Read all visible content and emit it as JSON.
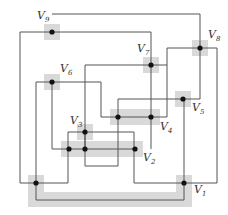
{
  "diagram": {
    "type": "grid-graph",
    "colors": {
      "line": "#555555",
      "highlight": "#d9d9d9",
      "dot": "#111111"
    },
    "vertices": [
      {
        "id": "V1",
        "label": "V",
        "sub": "1",
        "x": 184,
        "y": 183,
        "lx": 194,
        "ly": 193
      },
      {
        "id": "V2",
        "label": "V",
        "sub": "2",
        "x": 135,
        "y": 149,
        "lx": 143,
        "ly": 161
      },
      {
        "id": "V3",
        "label": "V",
        "sub": "3",
        "x": 85,
        "y": 132,
        "lx": 70,
        "ly": 124
      },
      {
        "id": "V4",
        "label": "V",
        "sub": "4",
        "x": 151,
        "y": 117,
        "lx": 160,
        "ly": 130
      },
      {
        "id": "V5",
        "label": "V",
        "sub": "5",
        "x": 183,
        "y": 99,
        "lx": 192,
        "ly": 111
      },
      {
        "id": "V6",
        "label": "V",
        "sub": "6",
        "x": 52,
        "y": 82,
        "lx": 60,
        "ly": 72
      },
      {
        "id": "V7",
        "label": "V",
        "sub": "7",
        "x": 151,
        "y": 65,
        "lx": 137,
        "ly": 52
      },
      {
        "id": "V8",
        "label": "V",
        "sub": "8",
        "x": 200,
        "y": 48,
        "lx": 208,
        "ly": 38
      },
      {
        "id": "V9",
        "label": "V",
        "sub": "9",
        "x": 52,
        "y": 32,
        "lx": 37,
        "ly": 19
      }
    ],
    "extra_dots": [
      {
        "x": 118,
        "y": 117
      },
      {
        "x": 69,
        "y": 149
      },
      {
        "x": 85,
        "y": 149
      },
      {
        "x": 36,
        "y": 183
      }
    ],
    "highlights": [
      {
        "x": 44,
        "y": 24,
        "w": 16,
        "h": 16
      },
      {
        "x": 44,
        "y": 74,
        "w": 16,
        "h": 16
      },
      {
        "x": 143,
        "y": 57,
        "w": 16,
        "h": 16
      },
      {
        "x": 192,
        "y": 40,
        "w": 16,
        "h": 16
      },
      {
        "x": 175,
        "y": 91,
        "w": 16,
        "h": 16
      },
      {
        "x": 110,
        "y": 109,
        "w": 50,
        "h": 16
      },
      {
        "x": 77,
        "y": 124,
        "w": 16,
        "h": 16
      },
      {
        "x": 61,
        "y": 141,
        "w": 82,
        "h": 16
      },
      {
        "x": 28,
        "y": 175,
        "w": 16,
        "h": 32
      },
      {
        "x": 28,
        "y": 192,
        "w": 164,
        "h": 15
      },
      {
        "x": 176,
        "y": 175,
        "w": 16,
        "h": 32
      }
    ],
    "edges": [
      "M52,14 H200 V99 H118 V166",
      "M20,183 V32 H151 V149",
      "M36,200 V82 H101 V117 H167 V48 H217 V183 H134 V132 H68 V183 H20",
      "M52,82 V149 H134",
      "M85,132 V166 H118",
      "M85,65 H167",
      "M85,65 V149",
      "M36,200 H184 V99",
      "M183,183 H184"
    ]
  }
}
